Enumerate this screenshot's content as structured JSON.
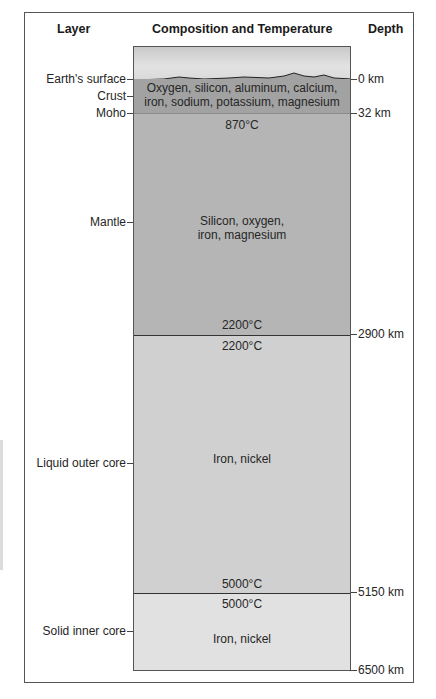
{
  "headers": {
    "layer": "Layer",
    "composition": "Composition and Temperature",
    "depth": "Depth"
  },
  "layers": [
    {
      "name": "Earth's surface"
    },
    {
      "name": "Crust",
      "composition_line1": "Oxygen, silicon, aluminum, calcium,",
      "composition_line2": "iron, sodium, potassium, magnesium"
    },
    {
      "name": "Moho"
    },
    {
      "name": "Mantle",
      "top_temp": "870°C",
      "composition_line1": "Silicon, oxygen,",
      "composition_line2": "iron, magnesium",
      "bottom_temp": "2200°C"
    },
    {
      "name": "Liquid outer core",
      "top_temp": "2200°C",
      "composition": "Iron, nickel",
      "bottom_temp": "5000°C"
    },
    {
      "name": "Solid inner core",
      "top_temp": "5000°C",
      "composition": "Iron, nickel"
    }
  ],
  "depths": [
    "0 km",
    "32 km",
    "2900 km",
    "5150 km",
    "6500 km"
  ],
  "colors": {
    "sky": "#d6d6d6",
    "crust": "#a2a2a2",
    "mantle": "#b5b5b5",
    "outer_core": "#d0d0d0",
    "inner_core": "#e1e1e1",
    "border": "#555555"
  }
}
